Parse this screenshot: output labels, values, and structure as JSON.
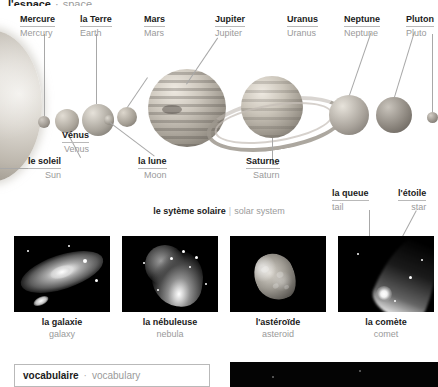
{
  "page_title": {
    "fr": "l'espace",
    "separator": "·",
    "en": "space"
  },
  "solar_system": {
    "caption": {
      "fr": "le sytème solaire",
      "separator": "|",
      "en": "solar system"
    },
    "bodies": [
      {
        "id": "sun",
        "fr": "le soleil",
        "en": "Sun",
        "icon": "sun-sphere"
      },
      {
        "id": "mercury",
        "fr": "Mercure",
        "en": "Mercury",
        "icon": "planet-sphere"
      },
      {
        "id": "venus",
        "fr": "Vénus",
        "en": "Venus",
        "icon": "planet-sphere"
      },
      {
        "id": "earth",
        "fr": "la Terre",
        "en": "Earth",
        "icon": "planet-sphere"
      },
      {
        "id": "moon",
        "fr": "la lune",
        "en": "Moon",
        "icon": "moon-sphere"
      },
      {
        "id": "mars",
        "fr": "Mars",
        "en": "Mars",
        "icon": "planet-sphere"
      },
      {
        "id": "jupiter",
        "fr": "Jupiter",
        "en": "Jupiter",
        "icon": "gas-giant-sphere"
      },
      {
        "id": "saturn",
        "fr": "Saturne",
        "en": "Saturn",
        "icon": "ringed-planet"
      },
      {
        "id": "uranus",
        "fr": "Uranus",
        "en": "Uranus",
        "icon": "planet-sphere"
      },
      {
        "id": "neptune",
        "fr": "Neptune",
        "en": "Neptune",
        "icon": "planet-sphere"
      },
      {
        "id": "pluto",
        "fr": "Pluton",
        "en": "Pluto",
        "icon": "dwarf-planet-sphere"
      }
    ]
  },
  "comet_parts": [
    {
      "id": "tail",
      "fr": "la queue",
      "en": "tail"
    },
    {
      "id": "star",
      "fr": "l'étoile",
      "en": "star"
    }
  ],
  "deep_sky": [
    {
      "id": "galaxy",
      "fr": "la galaxie",
      "en": "galaxy",
      "icon": "galaxy-photo"
    },
    {
      "id": "nebula",
      "fr": "la nébuleuse",
      "en": "nebula",
      "icon": "nebula-photo"
    },
    {
      "id": "asteroid",
      "fr": "l'astéroïde",
      "en": "asteroid",
      "icon": "asteroid-photo"
    },
    {
      "id": "comet",
      "fr": "la comète",
      "en": "comet",
      "icon": "comet-photo"
    }
  ],
  "vocabulary_box": {
    "fr": "vocabulaire",
    "separator": "·",
    "en": "vocabulary"
  },
  "colors": {
    "text_fr": "#1b1b1b",
    "text_en": "#9a9a9a",
    "rule": "#b9b9b9",
    "leader": "#a8a8a8",
    "photo_bg": "#000000"
  }
}
